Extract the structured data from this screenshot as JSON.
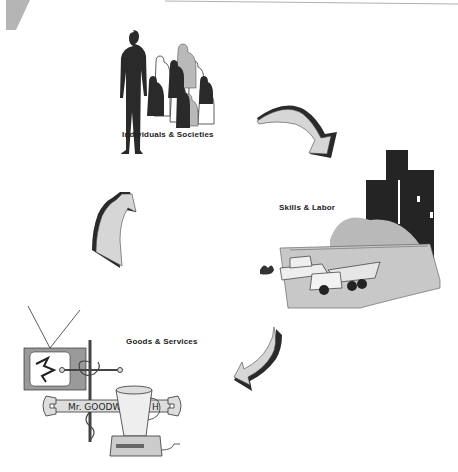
{
  "diagram": {
    "type": "cycle",
    "nodes": [
      {
        "id": "individuals",
        "label": "Individuals & Societies",
        "icon": "people-crowd-icon"
      },
      {
        "id": "skills",
        "label": "Skills & Labor",
        "icon": "construction-city-icon"
      },
      {
        "id": "goods",
        "label": "Goods & Services",
        "icon": "products-collage-icon"
      }
    ],
    "edges": [
      {
        "from": "individuals",
        "to": "skills"
      },
      {
        "from": "skills",
        "to": "goods"
      },
      {
        "from": "goods",
        "to": "individuals"
      }
    ],
    "wrench_text": "Mr. GOODW",
    "wrench_text_end": "H"
  },
  "colors": {
    "dark": "#2a2a2a",
    "gray": "#b8b8b8",
    "light": "#d9d9d9",
    "line": "#999999"
  }
}
